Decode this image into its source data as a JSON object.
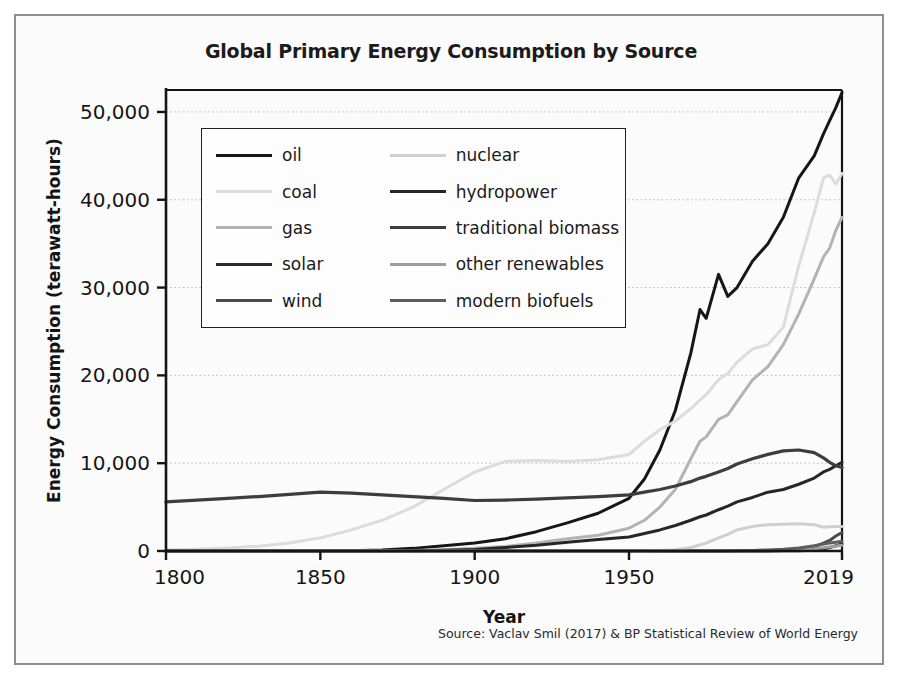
{
  "figure": {
    "title": "Global Primary Energy Consumption by Source",
    "source": "Source: Vaclav Smil (2017) & BP Statistical Review of World Energy",
    "background": "#fbfbfb",
    "border_color": "#8d8f92"
  },
  "chart_data": {
    "type": "line",
    "title": "Global Primary Energy Consumption by Source",
    "xlabel": "Year",
    "ylabel": "Energy Consumption (terawatt-hours)",
    "xlim": [
      1800,
      2019
    ],
    "ylim": [
      0,
      52500
    ],
    "grid": true,
    "legend_position": "upper-left-inside",
    "xticks": [
      1800,
      1850,
      1900,
      1950,
      2019
    ],
    "xtick_labels": [
      "1800",
      "1850",
      "1900",
      "1950",
      "2019"
    ],
    "yticks": [
      0,
      10000,
      20000,
      30000,
      40000,
      50000
    ],
    "ytick_labels": [
      "0",
      "10,000",
      "20,000",
      "30,000",
      "40,000",
      "50,000"
    ],
    "x": [
      1800,
      1810,
      1820,
      1830,
      1840,
      1850,
      1860,
      1870,
      1880,
      1890,
      1900,
      1910,
      1920,
      1930,
      1940,
      1950,
      1955,
      1960,
      1965,
      1970,
      1973,
      1975,
      1979,
      1982,
      1985,
      1990,
      1995,
      2000,
      2005,
      2010,
      2013,
      2015,
      2017,
      2019
    ],
    "series": [
      {
        "name": "oil",
        "color": "#161616",
        "width": 3.0,
        "values": [
          0,
          0,
          0,
          0,
          0,
          0,
          30,
          120,
          300,
          600,
          900,
          1400,
          2200,
          3200,
          4300,
          6000,
          8200,
          11500,
          16000,
          22500,
          27500,
          26500,
          31500,
          29000,
          30000,
          33000,
          35000,
          38000,
          42500,
          45000,
          47500,
          49000,
          50500,
          52200
        ]
      },
      {
        "name": "coal",
        "color": "#dcdcdc",
        "width": 3.0,
        "values": [
          100,
          200,
          350,
          550,
          900,
          1500,
          2400,
          3500,
          5000,
          7000,
          9000,
          10200,
          10300,
          10200,
          10400,
          11000,
          12500,
          13800,
          14800,
          16200,
          17200,
          17800,
          19500,
          20200,
          21500,
          23000,
          23500,
          25500,
          32500,
          38500,
          42500,
          42800,
          41800,
          43000
        ]
      },
      {
        "name": "gas",
        "color": "#b3b3b3",
        "width": 3.0,
        "values": [
          0,
          0,
          0,
          0,
          0,
          0,
          0,
          20,
          60,
          150,
          300,
          500,
          900,
          1400,
          1800,
          2600,
          3500,
          5000,
          7000,
          10500,
          12500,
          13000,
          15000,
          15500,
          17000,
          19500,
          21000,
          23500,
          27000,
          31000,
          33500,
          34500,
          36500,
          38000
        ]
      },
      {
        "name": "solar",
        "color": "#2b2b2b",
        "width": 3.0,
        "values": [
          0,
          0,
          0,
          0,
          0,
          0,
          0,
          0,
          0,
          0,
          0,
          0,
          0,
          0,
          0,
          0,
          0,
          0,
          0,
          0,
          0,
          0,
          0,
          0,
          0,
          5,
          10,
          20,
          40,
          90,
          220,
          380,
          600,
          800
        ]
      },
      {
        "name": "wind",
        "color": "#4a4a4a",
        "width": 3.0,
        "values": [
          0,
          0,
          0,
          0,
          0,
          0,
          0,
          0,
          0,
          0,
          0,
          0,
          0,
          0,
          0,
          0,
          0,
          0,
          0,
          0,
          0,
          0,
          0,
          0,
          2,
          10,
          25,
          80,
          180,
          500,
          900,
          1200,
          1700,
          2100
        ]
      },
      {
        "name": "nuclear",
        "color": "#cfcfcf",
        "width": 3.0,
        "values": [
          0,
          0,
          0,
          0,
          0,
          0,
          0,
          0,
          0,
          0,
          0,
          0,
          0,
          0,
          0,
          0,
          10,
          50,
          150,
          400,
          700,
          900,
          1500,
          1900,
          2400,
          2800,
          3000,
          3050,
          3100,
          3000,
          2700,
          2750,
          2800,
          2800
        ]
      },
      {
        "name": "hydropower",
        "color": "#262626",
        "width": 3.0,
        "values": [
          0,
          0,
          0,
          0,
          0,
          0,
          0,
          10,
          30,
          80,
          180,
          400,
          650,
          1000,
          1300,
          1600,
          2000,
          2400,
          2900,
          3500,
          3900,
          4100,
          4700,
          5100,
          5600,
          6100,
          6700,
          7000,
          7600,
          8300,
          9000,
          9300,
          9700,
          10100
        ]
      },
      {
        "name": "traditional biomass",
        "color": "#3d3d3d",
        "width": 3.2,
        "values": [
          5600,
          5800,
          6000,
          6200,
          6450,
          6700,
          6600,
          6400,
          6200,
          6000,
          5750,
          5800,
          5900,
          6050,
          6200,
          6400,
          6700,
          7000,
          7400,
          7900,
          8300,
          8500,
          9000,
          9400,
          9900,
          10500,
          11000,
          11400,
          11500,
          11200,
          10600,
          10100,
          9700,
          9500
        ]
      },
      {
        "name": "other renewables",
        "color": "#9d9d9d",
        "width": 3.0,
        "values": [
          0,
          0,
          0,
          0,
          0,
          0,
          0,
          0,
          0,
          0,
          0,
          0,
          0,
          0,
          0,
          0,
          0,
          0,
          0,
          0,
          0,
          0,
          0,
          0,
          0,
          5,
          20,
          60,
          130,
          250,
          380,
          450,
          560,
          650
        ]
      },
      {
        "name": "modern biofuels",
        "color": "#5e5e5e",
        "width": 3.0,
        "values": [
          0,
          0,
          0,
          0,
          0,
          0,
          0,
          0,
          0,
          0,
          0,
          0,
          0,
          0,
          0,
          0,
          0,
          0,
          0,
          0,
          0,
          0,
          0,
          10,
          30,
          70,
          120,
          200,
          340,
          600,
          800,
          900,
          1000,
          1100
        ]
      }
    ]
  },
  "legend": {
    "items": [
      {
        "label": "oil",
        "color": "#161616",
        "width": 3.2
      },
      {
        "label": "nuclear",
        "color": "#cfcfcf",
        "width": 3.0
      },
      {
        "label": "coal",
        "color": "#dcdcdc",
        "width": 3.0
      },
      {
        "label": "hydropower",
        "color": "#262626",
        "width": 3.2
      },
      {
        "label": "gas",
        "color": "#b3b3b3",
        "width": 3.0
      },
      {
        "label": "traditional biomass",
        "color": "#3d3d3d",
        "width": 3.0
      },
      {
        "label": "solar",
        "color": "#2b2b2b",
        "width": 3.2
      },
      {
        "label": "other renewables",
        "color": "#9d9d9d",
        "width": 3.0
      },
      {
        "label": "wind",
        "color": "#4a4a4a",
        "width": 3.0
      },
      {
        "label": "modern biofuels",
        "color": "#5e5e5e",
        "width": 3.0
      }
    ]
  }
}
